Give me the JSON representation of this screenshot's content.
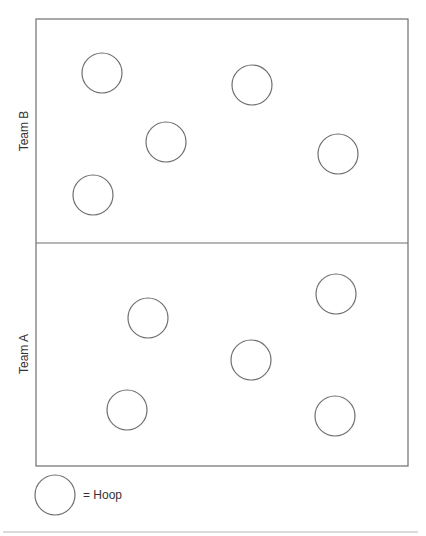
{
  "diagram": {
    "field": {
      "x": 36,
      "y": 19,
      "width": 372,
      "height": 447,
      "divider_y": 243
    },
    "zones": [
      {
        "label": "Team B",
        "label_x": 24,
        "label_y": 131
      },
      {
        "label": "Team A",
        "label_x": 24,
        "label_y": 354
      }
    ],
    "hoop_radius": 20,
    "hoops": {
      "team_b": [
        {
          "cx": 102,
          "cy": 73
        },
        {
          "cx": 252,
          "cy": 85
        },
        {
          "cx": 166,
          "cy": 142
        },
        {
          "cx": 338,
          "cy": 154
        },
        {
          "cx": 93,
          "cy": 195
        }
      ],
      "team_a": [
        {
          "cx": 336,
          "cy": 294
        },
        {
          "cx": 148,
          "cy": 318
        },
        {
          "cx": 251,
          "cy": 360
        },
        {
          "cx": 127,
          "cy": 410
        },
        {
          "cx": 335,
          "cy": 416
        }
      ]
    },
    "legend": {
      "symbol": "circle",
      "cx": 55,
      "cy": 495,
      "text": "= Hoop"
    },
    "stroke_color": "#6f6f6f"
  }
}
